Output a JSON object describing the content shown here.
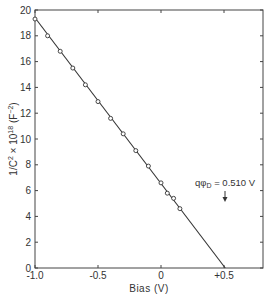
{
  "chart_data": {
    "type": "line",
    "title": "",
    "xlabel": "Bias (V)",
    "ylabel": "1/C² × 10¹⁸ (F⁻²)",
    "xlim": [
      -1.0,
      0.85
    ],
    "ylim": [
      0,
      20
    ],
    "x_ticks": [
      -1.0,
      -0.5,
      0,
      0.5
    ],
    "x_tick_labels": [
      "-1.0",
      "-0.5",
      "0",
      "+0.5"
    ],
    "y_ticks": [
      0,
      2,
      4,
      6,
      8,
      10,
      12,
      14,
      16,
      18,
      20
    ],
    "y_tick_labels": [
      "0",
      "2",
      "4",
      "6",
      "8",
      "10",
      "12",
      "14",
      "16",
      "18",
      "20"
    ],
    "grid": false,
    "series": [
      {
        "name": "measured",
        "style": "open-circle markers",
        "x": [
          -1.0,
          -0.9,
          -0.8,
          -0.7,
          -0.6,
          -0.5,
          -0.4,
          -0.3,
          -0.2,
          -0.1,
          0.0,
          0.05,
          0.1,
          0.15
        ],
        "y": [
          19.3,
          18.0,
          16.8,
          15.5,
          14.2,
          12.9,
          11.6,
          10.4,
          9.1,
          7.9,
          6.6,
          5.8,
          5.4,
          4.6
        ]
      },
      {
        "name": "linear fit",
        "style": "solid line",
        "x": [
          -1.0,
          0.51
        ],
        "y": [
          19.4,
          0
        ]
      }
    ],
    "annotations": [
      {
        "text": "qφ_D = 0.510 V",
        "x": 0.51,
        "y": 5.2,
        "arrow": "down"
      }
    ]
  },
  "labels": {
    "xlabel": "Bias (V)",
    "ylabel_main": "1/C",
    "ylabel_sup1": "2",
    "ylabel_mid": " × 10",
    "ylabel_sup2": "18",
    "ylabel_unit": " (F",
    "ylabel_sup3": "−2",
    "ylabel_end": ")",
    "annotation": "qφ",
    "annotation_sub": "D",
    "annotation_value": " = 0.510 V"
  }
}
